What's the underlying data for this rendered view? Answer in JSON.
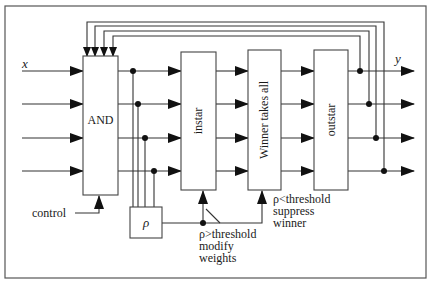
{
  "diagram": {
    "input_label": "x",
    "output_label": "y",
    "blocks": {
      "and": "AND",
      "instar": "instar",
      "wta": "Winner takes all",
      "outstar": "outstar",
      "rho": "ρ"
    },
    "control_label": "control",
    "modify": {
      "line1": "ρ>threshold",
      "line2": "modify",
      "line3": "weights"
    },
    "suppress": {
      "line1": "ρ<threshold",
      "line2": "suppress",
      "line3": "winner"
    }
  }
}
